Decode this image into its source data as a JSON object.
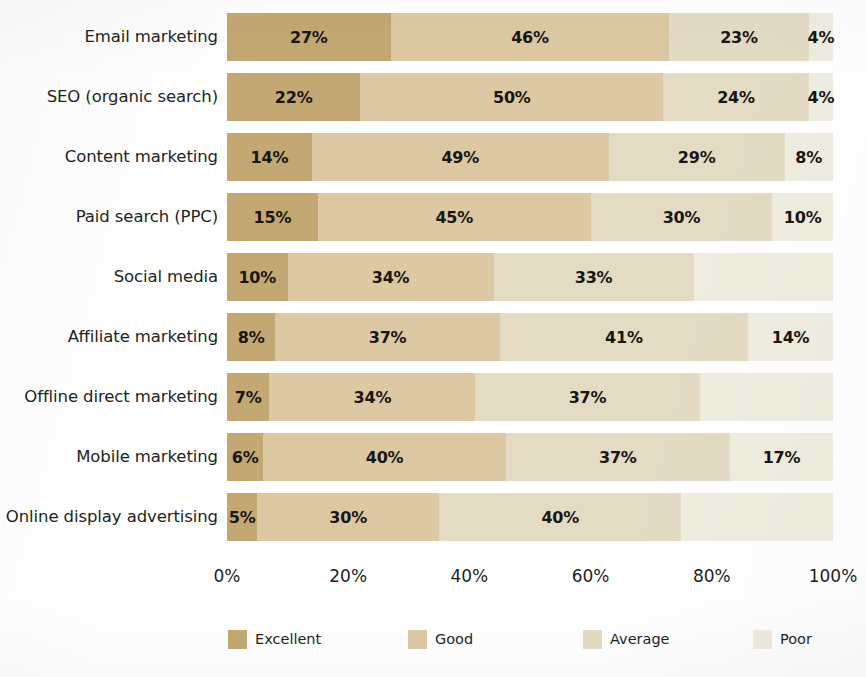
{
  "chart_data": {
    "type": "bar",
    "subtype": "horizontal-stacked-100",
    "title": "",
    "subtitle": "",
    "xlabel": "",
    "ylabel": "",
    "xlim": [
      0,
      100
    ],
    "grid": false,
    "legend_position": "bottom",
    "xticks": [
      0,
      20,
      40,
      60,
      80,
      100
    ],
    "xtick_labels": [
      "0%",
      "20%",
      "40%",
      "60%",
      "80%",
      "100%"
    ],
    "categories": [
      "Email marketing",
      "SEO (organic search)",
      "Content marketing",
      "Paid search (PPC)",
      "Social media",
      "Affiliate marketing",
      "Offline direct marketing",
      "Mobile marketing",
      "Online display advertising"
    ],
    "series": [
      {
        "name": "Excellent",
        "color": "#c4a873",
        "values": [
          27,
          22,
          14,
          15,
          10,
          8,
          7,
          6,
          5
        ],
        "labels": [
          "27%",
          "22%",
          "14%",
          "15%",
          "10%",
          "8%",
          "7%",
          "6%",
          "5%"
        ]
      },
      {
        "name": "Good",
        "color": "#dcc9a4",
        "values": [
          46,
          50,
          49,
          45,
          34,
          37,
          34,
          40,
          30
        ],
        "labels": [
          "46%",
          "50%",
          "49%",
          "45%",
          "34%",
          "37%",
          "34%",
          "40%",
          "30%"
        ]
      },
      {
        "name": "Average",
        "color": "#e4dbc5",
        "values": [
          23,
          24,
          29,
          30,
          33,
          41,
          37,
          37,
          40
        ],
        "labels": [
          "23%",
          "24%",
          "29%",
          "30%",
          "33%",
          "41%",
          "37%",
          "37%",
          "40%"
        ]
      },
      {
        "name": "Poor",
        "color": "#efece0",
        "values": [
          4,
          4,
          8,
          10,
          23,
          14,
          22,
          17,
          25
        ],
        "labels": [
          "4%",
          "4%",
          "8%",
          "10%",
          "23%",
          "14%",
          "22%",
          "17%",
          "25%"
        ]
      }
    ],
    "value_label_visibility": [
      [
        true,
        true,
        true,
        true
      ],
      [
        true,
        true,
        true,
        true
      ],
      [
        true,
        true,
        true,
        true
      ],
      [
        true,
        true,
        true,
        true
      ],
      [
        true,
        true,
        true,
        false
      ],
      [
        true,
        true,
        true,
        true
      ],
      [
        true,
        true,
        true,
        false
      ],
      [
        true,
        true,
        true,
        true
      ],
      [
        true,
        true,
        true,
        false
      ]
    ],
    "legend": [
      {
        "label": "Excellent",
        "color": "#c4a873"
      },
      {
        "label": "Good",
        "color": "#dcc9a4"
      },
      {
        "label": "Average",
        "color": "#e4dbc5"
      },
      {
        "label": "Poor",
        "color": "#efece0"
      }
    ]
  },
  "layout": {
    "plot_left": 227,
    "plot_width": 606,
    "row_top": 13,
    "row_pitch": 60,
    "bar_height": 48,
    "legend_x": [
      228,
      408,
      583,
      753
    ]
  }
}
